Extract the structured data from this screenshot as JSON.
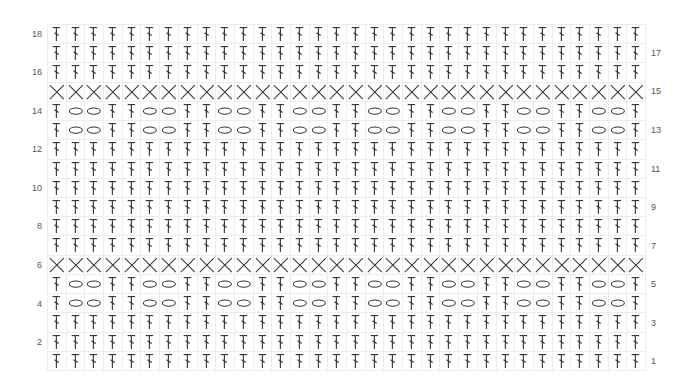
{
  "chart": {
    "rows": 18,
    "columns": 32,
    "colors": {
      "grid": "#ececec",
      "stitch": "#333333",
      "label": "#555555"
    },
    "legend_symbols": {
      "dc": "double-crochet-icon",
      "ch": "chain-oval-icon",
      "x": "single-crochet-x-icon"
    },
    "row_patterns": {
      "1": "dc",
      "2": "dc",
      "3": "dc",
      "4": "lace",
      "5": "lace",
      "6": "x",
      "7": "dc",
      "8": "dc",
      "9": "dc",
      "10": "dc",
      "11": "dc",
      "12": "dc",
      "13": "lace",
      "14": "lace",
      "15": "x",
      "16": "dc",
      "17": "dc",
      "18": "dc"
    },
    "repeat_lace": [
      "dc",
      "ch",
      "ch",
      "dc"
    ],
    "labels_left": [
      "18",
      "16",
      "14",
      "12",
      "10",
      "8",
      "6",
      "4",
      "2"
    ],
    "labels_right": [
      "17",
      "15",
      "13",
      "11",
      "9",
      "7",
      "5",
      "3",
      "1"
    ]
  }
}
